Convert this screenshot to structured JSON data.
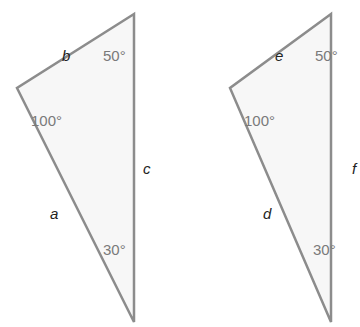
{
  "colors": {
    "stroke": "#8c8c8c",
    "fill": "#f7f7f7",
    "angle_text": "#7a7a7a",
    "side_text": "#222222"
  },
  "triangles": [
    {
      "id": "left",
      "vertices": {
        "top": [
          134,
          14
        ],
        "left": [
          17,
          88
        ],
        "bottom": [
          134,
          322
        ]
      },
      "angles": {
        "top": "50°",
        "left": "100°",
        "bottom": "30°"
      },
      "sides": {
        "upper": "b",
        "lower": "a",
        "right": "c"
      }
    },
    {
      "id": "right",
      "vertices": {
        "top": [
          331,
          14
        ],
        "left": [
          230,
          88
        ],
        "bottom": [
          331,
          322
        ]
      },
      "angles": {
        "top": "50°",
        "left": "100°",
        "bottom": "30°"
      },
      "sides": {
        "upper": "e",
        "lower": "d",
        "right": "f"
      }
    }
  ]
}
